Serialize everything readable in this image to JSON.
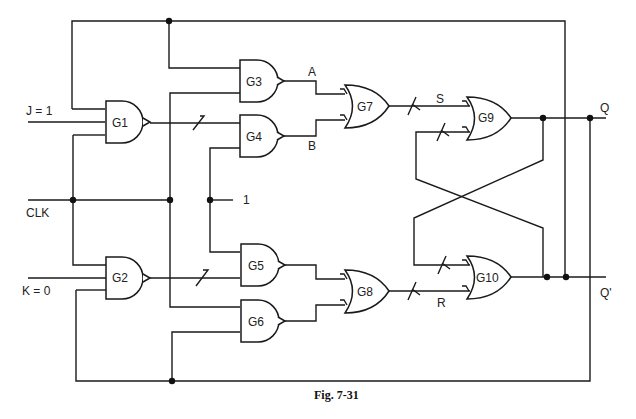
{
  "figure": {
    "caption": "Fig. 7-31"
  },
  "inputs": {
    "j": "J = 1",
    "k": "K = 0",
    "clk": "CLK",
    "const_one": "1"
  },
  "signals": {
    "a": "A",
    "b": "B",
    "s": "S",
    "r": "R"
  },
  "outputs": {
    "q": "Q",
    "q_prime": "Q'"
  },
  "gates": [
    {
      "id": "G1",
      "type": "NAND"
    },
    {
      "id": "G2",
      "type": "NAND"
    },
    {
      "id": "G3",
      "type": "NAND"
    },
    {
      "id": "G4",
      "type": "NAND"
    },
    {
      "id": "G5",
      "type": "NAND"
    },
    {
      "id": "G6",
      "type": "NAND"
    },
    {
      "id": "G7",
      "type": "OR"
    },
    {
      "id": "G8",
      "type": "OR"
    },
    {
      "id": "G9",
      "type": "OR"
    },
    {
      "id": "G10",
      "type": "OR"
    }
  ]
}
